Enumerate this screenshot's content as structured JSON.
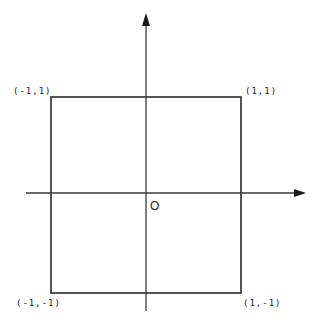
{
  "diagram": {
    "type": "coordinate-square",
    "colors": {
      "stroke": "#2a2a2a",
      "background": "#ffffff",
      "text": "#222222"
    },
    "origin_label": "O",
    "vertices": [
      {
        "id": "top-left",
        "label": "(-1,1)",
        "x": -1,
        "y": 1
      },
      {
        "id": "top-right",
        "label": "(1,1)",
        "x": 1,
        "y": 1
      },
      {
        "id": "bottom-left",
        "label": "(-1,-1)",
        "x": -1,
        "y": -1
      },
      {
        "id": "bottom-right",
        "label": "(1,-1)",
        "x": 1,
        "y": -1
      }
    ],
    "axes": {
      "x": {
        "arrow": "right"
      },
      "y": {
        "arrow": "up"
      }
    }
  }
}
